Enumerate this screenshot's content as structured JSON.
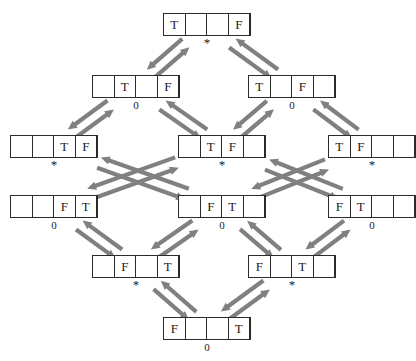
{
  "diagram": {
    "canvas": {
      "width": 416,
      "height": 361
    },
    "colors": {
      "background": "#ffffff",
      "box_border": "#2b2b2b",
      "text": "#1a1a1a",
      "arrow": "#808080"
    },
    "empty_cell": "",
    "nodes": [
      {
        "id": "n1",
        "row": 1,
        "x": 163,
        "y": 13,
        "cells": [
          "T",
          "",
          "",
          "F"
        ],
        "label": "*",
        "label_kind": "star"
      },
      {
        "id": "n2a",
        "row": 2,
        "x": 92,
        "y": 75,
        "cells": [
          "",
          "T",
          "",
          "F"
        ],
        "label": "0",
        "label_kind": "digit"
      },
      {
        "id": "n2b",
        "row": 2,
        "x": 248,
        "y": 75,
        "cells": [
          "T",
          "",
          "F",
          ""
        ],
        "label": "0",
        "label_kind": "digit"
      },
      {
        "id": "n3a",
        "row": 3,
        "x": 10,
        "y": 135,
        "cells": [
          "",
          "",
          "T",
          "F"
        ],
        "label": "*",
        "label_kind": "star"
      },
      {
        "id": "n3b",
        "row": 3,
        "x": 178,
        "y": 135,
        "cells": [
          "",
          "T",
          "F",
          ""
        ],
        "label": "*",
        "label_kind": "star"
      },
      {
        "id": "n3c",
        "row": 3,
        "x": 328,
        "y": 135,
        "cells": [
          "T",
          "F",
          "",
          ""
        ],
        "label": "*",
        "label_kind": "star"
      },
      {
        "id": "n4a",
        "row": 4,
        "x": 10,
        "y": 195,
        "cells": [
          "",
          "",
          "F",
          "T"
        ],
        "label": "0",
        "label_kind": "digit"
      },
      {
        "id": "n4b",
        "row": 4,
        "x": 178,
        "y": 195,
        "cells": [
          "",
          "F",
          "T",
          ""
        ],
        "label": "0",
        "label_kind": "digit"
      },
      {
        "id": "n4c",
        "row": 4,
        "x": 328,
        "y": 195,
        "cells": [
          "F",
          "T",
          "",
          ""
        ],
        "label": "0",
        "label_kind": "digit"
      },
      {
        "id": "n5a",
        "row": 5,
        "x": 92,
        "y": 255,
        "cells": [
          "",
          "F",
          "",
          "T"
        ],
        "label": "*",
        "label_kind": "star"
      },
      {
        "id": "n5b",
        "row": 5,
        "x": 248,
        "y": 255,
        "cells": [
          "F",
          "",
          "T",
          ""
        ],
        "label": "*",
        "label_kind": "star"
      },
      {
        "id": "n6",
        "row": 6,
        "x": 163,
        "y": 317,
        "cells": [
          "F",
          "",
          "",
          "T"
        ],
        "label": "0",
        "label_kind": "digit"
      }
    ],
    "edges": [
      {
        "from": "n1",
        "to": "n2a",
        "style": "double-headed-pair"
      },
      {
        "from": "n1",
        "to": "n2b",
        "style": "double-headed-pair"
      },
      {
        "from": "n2a",
        "to": "n3a",
        "style": "double-headed-pair"
      },
      {
        "from": "n2a",
        "to": "n3b",
        "style": "double-headed-pair"
      },
      {
        "from": "n2b",
        "to": "n3b",
        "style": "double-headed-pair"
      },
      {
        "from": "n2b",
        "to": "n3c",
        "style": "double-headed-pair"
      },
      {
        "from": "n3a",
        "to": "n4b",
        "style": "double-headed-pair"
      },
      {
        "from": "n3b",
        "to": "n4a",
        "style": "double-headed-pair"
      },
      {
        "from": "n3b",
        "to": "n4c",
        "style": "double-headed-pair"
      },
      {
        "from": "n3c",
        "to": "n4b",
        "style": "double-headed-pair"
      },
      {
        "from": "n4a",
        "to": "n5a",
        "style": "double-headed-pair"
      },
      {
        "from": "n4b",
        "to": "n5a",
        "style": "double-headed-pair"
      },
      {
        "from": "n4b",
        "to": "n5b",
        "style": "double-headed-pair"
      },
      {
        "from": "n4c",
        "to": "n5b",
        "style": "double-headed-pair"
      },
      {
        "from": "n5a",
        "to": "n6",
        "style": "double-headed-pair"
      },
      {
        "from": "n5b",
        "to": "n6",
        "style": "double-headed-pair"
      }
    ]
  }
}
